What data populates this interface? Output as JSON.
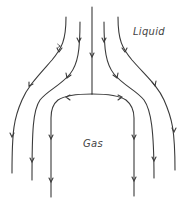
{
  "diagram": {
    "type": "flow-streamlines",
    "labels": {
      "liquid": "Liquid",
      "gas": "Gas"
    },
    "colors": {
      "stroke": "#3a3a3a",
      "text": "#444444",
      "background": "#ffffff"
    },
    "streamlines": [
      {
        "id": "left-outer",
        "region": "liquid"
      },
      {
        "id": "left-middle",
        "region": "liquid"
      },
      {
        "id": "center-left-branch",
        "region": "interface"
      },
      {
        "id": "center-right-branch",
        "region": "interface"
      },
      {
        "id": "right-middle",
        "region": "liquid"
      },
      {
        "id": "right-outer",
        "region": "liquid"
      }
    ]
  }
}
